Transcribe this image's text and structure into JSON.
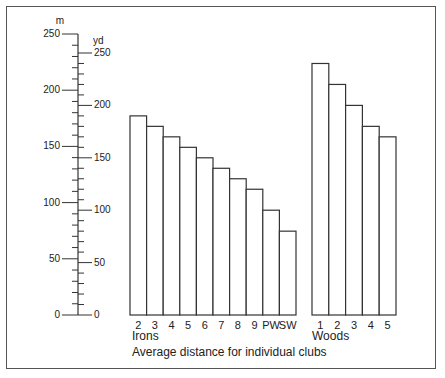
{
  "chart_data": {
    "type": "bar",
    "title": "Average distance for individual clubs",
    "xlabel": "",
    "ylabel_left": "m",
    "ylabel_right": "yd",
    "ylim_m": [
      0,
      250
    ],
    "ylim_yd": [
      0,
      250
    ],
    "m_ticks": [
      0,
      50,
      100,
      150,
      200,
      250
    ],
    "yd_ticks": [
      0,
      50,
      100,
      150,
      200,
      250
    ],
    "grid": false,
    "groups": [
      {
        "name": "Irons",
        "categories": [
          "2",
          "3",
          "4",
          "5",
          "6",
          "7",
          "8",
          "9",
          "PW",
          "SW"
        ],
        "values_yd": [
          190,
          180,
          170,
          160,
          150,
          140,
          130,
          120,
          100,
          80
        ]
      },
      {
        "name": "Woods",
        "categories": [
          "1",
          "2",
          "3",
          "4",
          "5"
        ],
        "values_yd": [
          240,
          220,
          200,
          180,
          170
        ]
      }
    ]
  },
  "labels": {
    "m_unit": "m",
    "yd_unit": "yd",
    "irons": "Irons",
    "woods": "Woods",
    "caption": "Average distance for individual clubs"
  },
  "colors": {
    "stroke": "#333333",
    "bar_fill": "#ffffff"
  }
}
